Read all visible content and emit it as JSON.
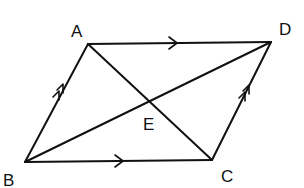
{
  "diagram": {
    "points": {
      "A": {
        "label": "A",
        "x": 88,
        "y": 44,
        "label_x": 71,
        "label_y": 37
      },
      "D": {
        "label": "D",
        "x": 271,
        "y": 42,
        "label_x": 279,
        "label_y": 35
      },
      "B": {
        "label": "B",
        "x": 25,
        "y": 162,
        "label_x": 3,
        "label_y": 186
      },
      "C": {
        "label": "C",
        "x": 212,
        "y": 160,
        "label_x": 221,
        "label_y": 182
      },
      "E": {
        "label": "E",
        "x": 150,
        "y": 102,
        "label_x": 143,
        "label_y": 130
      }
    },
    "edges": [
      {
        "from": "A",
        "to": "D",
        "marker": "single-arrow"
      },
      {
        "from": "B",
        "to": "C",
        "marker": "single-arrow"
      },
      {
        "from": "B",
        "to": "A",
        "marker": "double-arrow"
      },
      {
        "from": "C",
        "to": "D",
        "marker": "double-arrow"
      },
      {
        "from": "A",
        "to": "C",
        "marker": "none"
      },
      {
        "from": "B",
        "to": "D",
        "marker": "none"
      }
    ],
    "stroke_color": "#111111",
    "background": "#ffffff"
  }
}
